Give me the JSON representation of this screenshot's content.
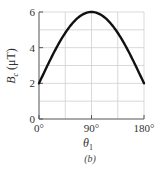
{
  "chart_data": {
    "type": "line",
    "title": "",
    "xlabel": "θ1",
    "ylabel": "Bc (μT)",
    "caption": "(b)",
    "xlim": [
      0,
      180
    ],
    "ylim": [
      0,
      6
    ],
    "x_ticks": [
      "0°",
      "90°",
      "180°"
    ],
    "y_ticks": [
      "0",
      "2",
      "4",
      "6"
    ],
    "grid": true,
    "grid_x_step": 45,
    "grid_y_step": 1,
    "series": [
      {
        "name": "Bc",
        "x": [
          0,
          15,
          30,
          45,
          60,
          75,
          90,
          105,
          120,
          135,
          150,
          165,
          180
        ],
        "values": [
          2.0,
          3.04,
          4.0,
          4.83,
          5.46,
          5.86,
          6.0,
          5.86,
          5.46,
          4.83,
          4.0,
          3.04,
          2.0
        ],
        "color": "#111111"
      }
    ]
  },
  "axes": {
    "x_label_main": "θ",
    "x_label_sub": "1",
    "y_label_main": "B",
    "y_label_sub": "c",
    "y_label_unit": " (μT)",
    "caption": "(b)"
  }
}
